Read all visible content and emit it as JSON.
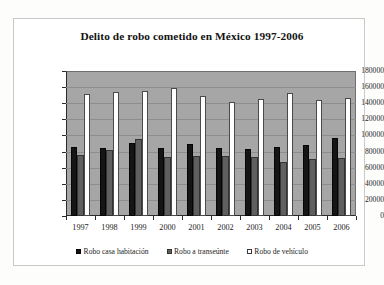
{
  "chart_data": {
    "type": "bar",
    "title": "Delito de robo cometido en México 1997-2006",
    "xlabel": "",
    "ylabel": "",
    "ylim": [
      0,
      180000
    ],
    "ytick_step": 20000,
    "yticks": [
      "180000",
      "160000",
      "140000",
      "120000",
      "100000",
      "80000",
      "60000",
      "40000",
      "20000",
      "0"
    ],
    "categories": [
      "1997",
      "1998",
      "1999",
      "2000",
      "2001",
      "2002",
      "2003",
      "2004",
      "2005",
      "2006"
    ],
    "grid": true,
    "legend_position": "bottom",
    "plot_background": "#a6a6a6",
    "series": [
      {
        "name": "Robo casa habitación",
        "color": "#151515",
        "values": [
          86000,
          84000,
          91000,
          85000,
          90000,
          84500,
          83000,
          85500,
          88500,
          97000
        ]
      },
      {
        "name": "Robo a transeúnte",
        "color": "#5f5f5f",
        "values": [
          76000,
          82000,
          95000,
          73000,
          75000,
          74500,
          73500,
          67000,
          71000,
          72000
        ]
      },
      {
        "name": "Robo de vehículo",
        "color": "#ffffff",
        "values": [
          151500,
          153500,
          155500,
          159000,
          149000,
          141000,
          145000,
          152500,
          143500,
          146500
        ]
      }
    ]
  }
}
